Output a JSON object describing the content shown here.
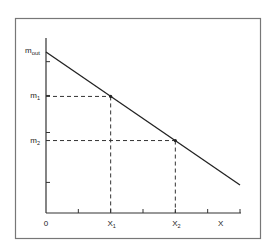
{
  "chart_data": {
    "type": "line",
    "title": "",
    "xlabel": "X",
    "ylabel": "m",
    "xlim": [
      0,
      6
    ],
    "ylim": [
      0,
      5
    ],
    "grid": false,
    "x_origin_label": "0",
    "x_ticks": [
      1,
      2,
      3,
      4,
      5,
      6
    ],
    "y_ticks": [
      0.95,
      2.5,
      3.65,
      4.7
    ],
    "series": [
      {
        "name": "m(X)",
        "x": [
          0,
          6
        ],
        "y": [
          5.0,
          0.87
        ]
      }
    ],
    "points": [
      {
        "name": "point-1",
        "x": 2,
        "y": 3.62,
        "x_label": "X1",
        "y_label": "m1"
      },
      {
        "name": "point-2",
        "x": 4,
        "y": 2.25,
        "x_label": "X2",
        "y_label": "m2"
      }
    ],
    "y_intercept_label": "m_out",
    "labels": {
      "origin": "0",
      "x_axis_end": "X",
      "x1_main": "X",
      "x1_sub": "1",
      "x2_main": "X",
      "x2_sub": "2",
      "m1_main": "m",
      "m1_sub": "1",
      "m2_main": "m",
      "m2_sub": "2",
      "mout_main": "m",
      "mout_sub": "out"
    },
    "colors": {
      "frame": "#777777",
      "axis": "#333333",
      "line": "#222222",
      "dashed": "#333333"
    }
  }
}
